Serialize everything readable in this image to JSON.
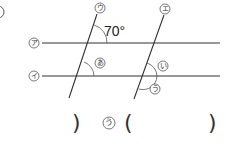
{
  "figure": {
    "line_labels": {
      "a": "ア",
      "i": "イ",
      "u": "ウ",
      "e": "エ"
    },
    "angle_given": "70°",
    "angle_labels": {
      "A": "あ",
      "I": "い",
      "U": "う"
    }
  },
  "answer_row": {
    "prev_close": ")",
    "label": "う",
    "open": "(",
    "close": ")"
  },
  "colors": {
    "line": "#333333",
    "arc": "#555555",
    "label_circle": "#555555"
  }
}
